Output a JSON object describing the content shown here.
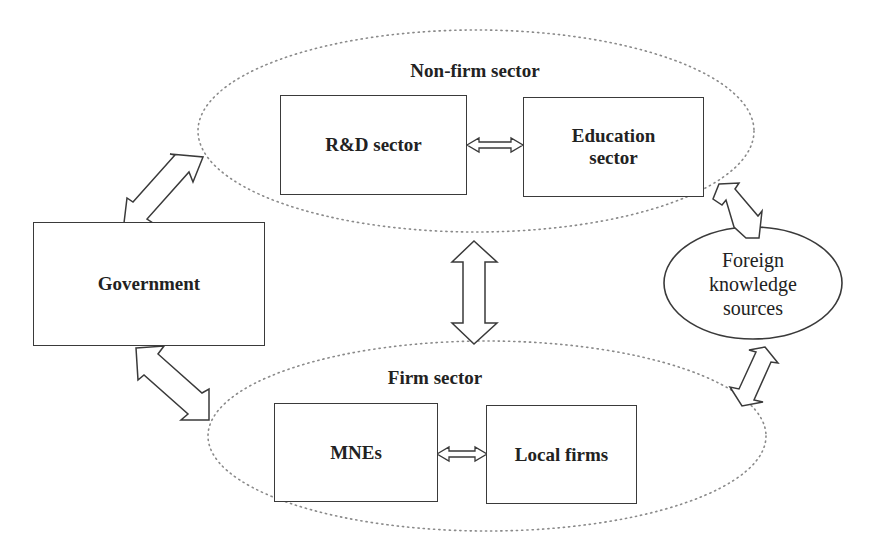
{
  "diagram": {
    "type": "knowledge-flow-system",
    "colors": {
      "stroke": "#3a3a3a",
      "dotted": "#8a8a8a",
      "fill": "#ffffff",
      "text": "#222222"
    },
    "groups": {
      "non_firm": {
        "title": "Non-firm sector",
        "nodes": {
          "rd": "R&D sector",
          "education": "Education sector"
        }
      },
      "firm": {
        "title": "Firm sector",
        "nodes": {
          "mnes": "MNEs",
          "local": "Local firms"
        }
      }
    },
    "nodes": {
      "government": "Government",
      "foreign": "Foreign knowledge sources"
    },
    "edges": [
      {
        "from": "R&D sector",
        "to": "Education sector",
        "type": "bidirectional"
      },
      {
        "from": "MNEs",
        "to": "Local firms",
        "type": "bidirectional"
      },
      {
        "from": "Non-firm sector",
        "to": "Firm sector",
        "type": "bidirectional"
      },
      {
        "from": "Government",
        "to": "Non-firm sector",
        "type": "bidirectional"
      },
      {
        "from": "Government",
        "to": "Firm sector",
        "type": "bidirectional"
      },
      {
        "from": "Foreign knowledge sources",
        "to": "Non-firm sector",
        "type": "bidirectional"
      },
      {
        "from": "Foreign knowledge sources",
        "to": "Firm sector",
        "type": "bidirectional"
      }
    ]
  }
}
